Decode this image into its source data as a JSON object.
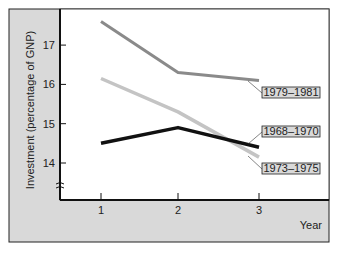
{
  "chart_data": {
    "type": "line",
    "title": "",
    "xlabel": "Year",
    "ylabel": "Investment (percentage of GNP)",
    "x": [
      1,
      2,
      3
    ],
    "x_tick_labels": [
      "1",
      "2",
      "3"
    ],
    "y_tick_labels": [
      "14",
      "15",
      "16",
      "17"
    ],
    "ylim": [
      13.1,
      17.9
    ],
    "axis_break": true,
    "grid": false,
    "series": [
      {
        "name": "1979–1981",
        "values": [
          17.6,
          16.3,
          16.1
        ],
        "color": "#8a8a8a"
      },
      {
        "name": "1973–1975",
        "values": [
          16.15,
          15.3,
          14.15
        ],
        "color": "#c4c4c4"
      },
      {
        "name": "1968–1970",
        "values": [
          14.5,
          14.9,
          14.4
        ],
        "color": "#111111"
      }
    ],
    "legend_position": "inline labels at right end of lines"
  },
  "colors": {
    "frame_background": "#d9d9d9",
    "plot_background": "#ffffff",
    "axis": "#111111"
  }
}
